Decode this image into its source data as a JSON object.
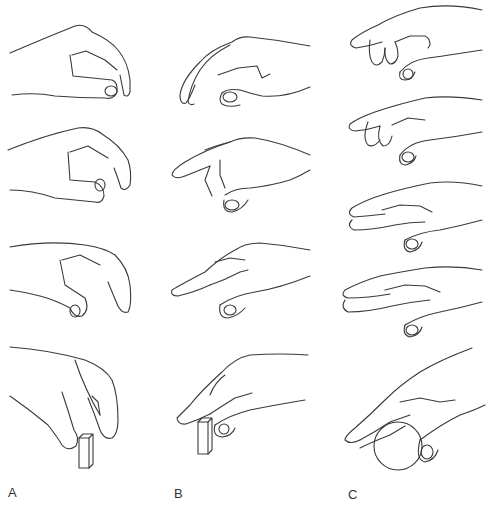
{
  "figure": {
    "columns": [
      {
        "label": "A",
        "description": "precision pinch of a small block, fingertip grasp",
        "panels": 4
      },
      {
        "label": "B",
        "description": "index-finger led approach to a small block",
        "panels": 4
      },
      {
        "label": "C",
        "description": "whole-hand approach enclosing a ball",
        "panels": 4
      }
    ],
    "rows": 4,
    "objects": {
      "A": "rectangular block",
      "B": "rectangular block",
      "C": "sphere"
    },
    "colors": {
      "line": "#3a3a3a",
      "background": "#ffffff"
    }
  }
}
